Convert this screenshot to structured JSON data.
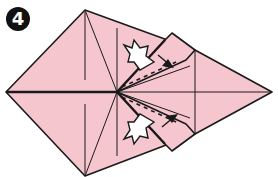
{
  "step": {
    "number": "4"
  },
  "colors": {
    "paper": "#f6c6cf",
    "line": "#1a1a1a",
    "background": "#ffffff",
    "arrow_fill": "#ffffff"
  },
  "diagram": {
    "elements": [
      "kite-shaped-base",
      "upper-flap-valley-fold-dashed",
      "lower-flap-valley-fold-dashed",
      "push-arrow-upper",
      "push-arrow-lower",
      "fold-arrow-upper",
      "fold-arrow-lower"
    ]
  }
}
